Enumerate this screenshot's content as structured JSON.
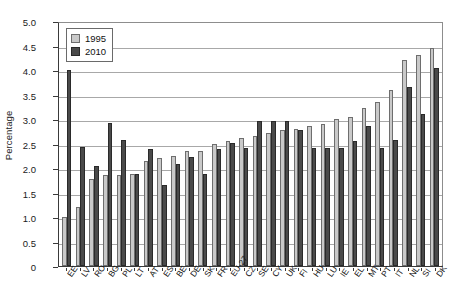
{
  "chart_data": {
    "type": "bar",
    "title": "",
    "subtitle": "",
    "xlabel": "",
    "ylabel": "Percentage",
    "ylim": [
      0,
      5.0
    ],
    "ytick_labels": [
      "5.0",
      "4.5",
      "4.0",
      "3.5",
      "3.0",
      "2.5",
      "2.0",
      "1.5",
      "1.0",
      "0.5",
      "0"
    ],
    "ytick_values": [
      5.0,
      4.5,
      4.0,
      3.5,
      3.0,
      2.5,
      2.0,
      1.5,
      1.0,
      0.5,
      0
    ],
    "grid": true,
    "grid_axis": "y",
    "legend_position": "top-left",
    "categories": [
      "EE",
      "LV",
      "RO",
      "BG",
      "PL",
      "LT",
      "AT",
      "ES",
      "BE",
      "DE",
      "SK",
      "FR",
      "EU-27",
      "CZ",
      "SE",
      "CY",
      "UK",
      "FI",
      "HU",
      "LU",
      "IE",
      "EL",
      "MT",
      "PT",
      "IT",
      "NL",
      "SI",
      "DK"
    ],
    "series": [
      {
        "name": "1995",
        "color": "#c9c9c9",
        "values": [
          1.0,
          1.2,
          1.78,
          1.85,
          1.85,
          1.88,
          2.15,
          2.2,
          2.25,
          2.35,
          2.35,
          2.5,
          2.55,
          2.62,
          2.65,
          2.72,
          2.78,
          2.8,
          2.85,
          2.9,
          3.0,
          3.05,
          3.22,
          3.35,
          3.6,
          4.2,
          4.3,
          4.45
        ]
      },
      {
        "name": "2010",
        "color": "#4a4a4a",
        "values": [
          4.0,
          2.42,
          2.05,
          2.92,
          2.58,
          1.88,
          2.38,
          1.66,
          2.09,
          2.23,
          1.88,
          2.38,
          2.52,
          2.4,
          2.95,
          2.95,
          2.95,
          2.78,
          2.4,
          2.4,
          2.4,
          2.55,
          2.85,
          2.4,
          2.58,
          3.65,
          3.1,
          4.05
        ]
      }
    ]
  },
  "legend": {
    "entries": [
      {
        "label": "1995"
      },
      {
        "label": "2010"
      }
    ]
  }
}
